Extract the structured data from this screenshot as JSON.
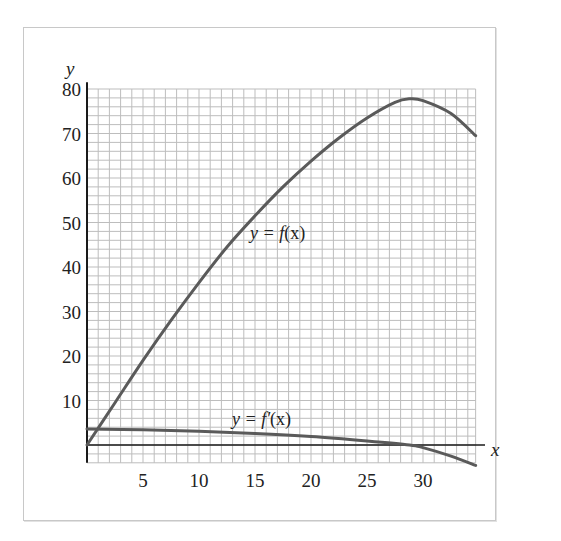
{
  "chart_data": {
    "type": "line",
    "title": "",
    "xlabel": "x",
    "ylabel": "y",
    "xlim": [
      0,
      35
    ],
    "ylim": [
      -4,
      80
    ],
    "x_ticks": [
      5,
      10,
      15,
      20,
      25,
      30
    ],
    "y_ticks": [
      10,
      20,
      30,
      40,
      50,
      60,
      70,
      80
    ],
    "grid": {
      "on": true,
      "x_minor_step": 1,
      "y_minor_step": 2
    },
    "legend": null,
    "annotations": [
      {
        "text": "y = f(x)",
        "x": 17,
        "y": 48
      },
      {
        "text": "y = f′(x)",
        "x": 16.5,
        "y": 6
      }
    ],
    "series": [
      {
        "name": "y = f(x)",
        "x": [
          0,
          2.5,
          5,
          7.5,
          10,
          12.5,
          15,
          17.5,
          20,
          22.5,
          25,
          27.5,
          28.8,
          30,
          32.5,
          34.7
        ],
        "y": [
          0,
          9.5,
          19,
          28,
          36.5,
          44.5,
          51.5,
          58,
          63.8,
          69,
          73.5,
          77,
          77.8,
          77.4,
          74.5,
          69.5
        ]
      },
      {
        "name": "y = f′(x)",
        "x": [
          0,
          5,
          10,
          15,
          20,
          25,
          28.8,
          30,
          32.5,
          34.7
        ],
        "y": [
          3.6,
          3.4,
          3.1,
          2.6,
          1.9,
          0.9,
          0,
          -0.6,
          -2.5,
          -4.6
        ]
      }
    ]
  },
  "labels": {
    "y_axis": "y",
    "x_axis": "x",
    "f_label_prefix": "y = ",
    "f_label_fn": "f",
    "f_label_arg": "(x)",
    "fp_label_prefix": "y = ",
    "fp_label_fn": "f′",
    "fp_label_arg": "(x)"
  },
  "colors": {
    "curve": "#5a5a5a",
    "grid": "#bdbdbd",
    "axis": "#1a1a1a",
    "frame": "#c8c8c8"
  }
}
